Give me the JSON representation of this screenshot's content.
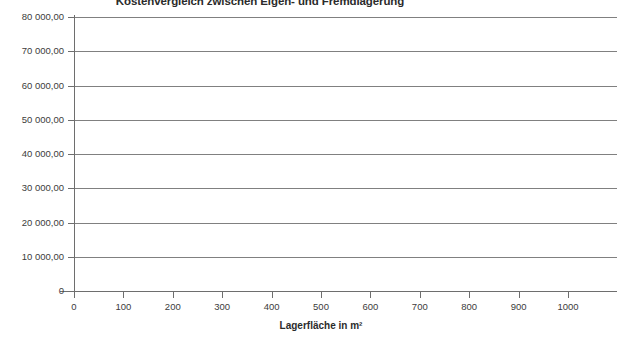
{
  "chart_data": {
    "type": "line",
    "title": "Kostenvergleich zwischen Eigen- und Fremdlagerung",
    "xlabel": "Lagerfläche in m²",
    "ylabel": "",
    "xlim": [
      0,
      1000
    ],
    "ylim": [
      0,
      80000
    ],
    "grid": true,
    "legend": null,
    "series": [],
    "x_ticks": [
      {
        "value": 0,
        "label": "0"
      },
      {
        "value": 100,
        "label": "100"
      },
      {
        "value": 200,
        "label": "200"
      },
      {
        "value": 300,
        "label": "300"
      },
      {
        "value": 400,
        "label": "400"
      },
      {
        "value": 500,
        "label": "500"
      },
      {
        "value": 600,
        "label": "600"
      },
      {
        "value": 700,
        "label": "700"
      },
      {
        "value": 800,
        "label": "800"
      },
      {
        "value": 900,
        "label": "900"
      },
      {
        "value": 1000,
        "label": "1000"
      }
    ],
    "y_ticks": [
      {
        "value": 80000,
        "label": "80 000,00"
      },
      {
        "value": 70000,
        "label": "70 000,00"
      },
      {
        "value": 60000,
        "label": "60 000,00"
      },
      {
        "value": 50000,
        "label": "50 000,00"
      },
      {
        "value": 40000,
        "label": "40 000,00"
      },
      {
        "value": 30000,
        "label": "30 000,00"
      },
      {
        "value": 20000,
        "label": "20 000,00"
      },
      {
        "value": 10000,
        "label": "10 000,00"
      },
      {
        "value": 0,
        "label": "0"
      }
    ],
    "colors": {
      "background": "#ffffff",
      "gridline": "#808080",
      "axis": "#6e6e6e",
      "tick_label": "#3c3c3c",
      "title": "#2b2b2b"
    }
  }
}
